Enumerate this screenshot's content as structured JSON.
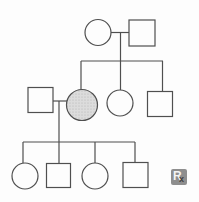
{
  "figure": {
    "type": "pedigree-chart",
    "background": "#fdfdfd",
    "line_color": "#4f4f4f",
    "line_width": 1.2,
    "unaffected_fill": "#fdfdfd",
    "affected_fill": "#dcdcdc",
    "affected_dot_color": "#b0b0b0"
  },
  "pedigree": {
    "individuals": [
      {
        "id": "I-1",
        "generation": "I",
        "sex": "female",
        "affected": false,
        "cx": 98,
        "cy": 32.5,
        "r": 13
      },
      {
        "id": "I-2",
        "generation": "I",
        "sex": "male",
        "affected": false,
        "cx": 142,
        "cy": 33,
        "r": 13
      },
      {
        "id": "II-1",
        "generation": "II",
        "sex": "male",
        "affected": false,
        "cx": 40.5,
        "cy": 100,
        "r": 12.5
      },
      {
        "id": "II-2",
        "generation": "II",
        "sex": "female",
        "affected": true,
        "cx": 82,
        "cy": 105,
        "r": 15.5
      },
      {
        "id": "II-3",
        "generation": "II",
        "sex": "female",
        "affected": false,
        "cx": 120,
        "cy": 103,
        "r": 13
      },
      {
        "id": "II-4",
        "generation": "II",
        "sex": "male",
        "affected": false,
        "cx": 160,
        "cy": 104,
        "r": 12.5
      },
      {
        "id": "III-1",
        "generation": "III",
        "sex": "female",
        "affected": false,
        "cx": 25,
        "cy": 176,
        "r": 13
      },
      {
        "id": "III-2",
        "generation": "III",
        "sex": "male",
        "affected": false,
        "cx": 58.5,
        "cy": 175.5,
        "r": 12
      },
      {
        "id": "III-3",
        "generation": "III",
        "sex": "female",
        "affected": false,
        "cx": 95,
        "cy": 176,
        "r": 13
      },
      {
        "id": "III-4",
        "generation": "III",
        "sex": "male",
        "affected": false,
        "cx": 135.5,
        "cy": 175,
        "r": 12.5
      }
    ],
    "connectors": [
      {
        "name": "gen1-couple-line",
        "points": [
          [
            111,
            32.5
          ],
          [
            129,
            32.5
          ]
        ]
      },
      {
        "name": "gen1-descent-line",
        "points": [
          [
            120.5,
            32.5
          ],
          [
            120.5,
            91
          ]
        ]
      },
      {
        "name": "gen2-sibship-line",
        "points": [
          [
            81,
            61
          ],
          [
            163,
            61
          ]
        ]
      },
      {
        "name": "gen2-drop-affected-daughter",
        "points": [
          [
            81,
            61
          ],
          [
            81,
            90
          ]
        ]
      },
      {
        "name": "gen2-drop-right-son",
        "points": [
          [
            162.5,
            61
          ],
          [
            162.5,
            92
          ]
        ]
      },
      {
        "name": "gen2-couple-line",
        "points": [
          [
            53,
            101
          ],
          [
            67,
            101
          ]
        ]
      },
      {
        "name": "gen2-descent-line",
        "points": [
          [
            59,
            101
          ],
          [
            59,
            164
          ]
        ]
      },
      {
        "name": "gen3-sibship-line",
        "points": [
          [
            23,
            142
          ],
          [
            135,
            142
          ]
        ]
      },
      {
        "name": "gen3-drop-daughter-1",
        "points": [
          [
            23,
            142
          ],
          [
            23,
            163.5
          ]
        ]
      },
      {
        "name": "gen3-drop-daughter-2",
        "points": [
          [
            95,
            142
          ],
          [
            95,
            163.5
          ]
        ]
      },
      {
        "name": "gen3-drop-son-2",
        "points": [
          [
            135,
            142
          ],
          [
            135,
            163
          ]
        ]
      }
    ]
  },
  "watermark": {
    "r_label": "R",
    "x_label": "x",
    "box_color": "#8e8e8e",
    "r_color": "#f4f4f4",
    "x_color": "#3f3f3f"
  }
}
